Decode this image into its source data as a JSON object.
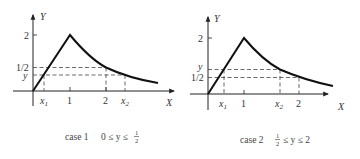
{
  "figure": {
    "panels": [
      {
        "id": "case1",
        "caption_case": "case 1",
        "caption_condition": "0 ≤ y ≤",
        "caption_frac_num": "1",
        "caption_frac_den": "2",
        "y_axis_label": "Y",
        "x_axis_label": "X",
        "y_ticks": [
          "2",
          "1/2",
          "y"
        ],
        "x_ticks": [
          "x",
          "1",
          "2",
          "x"
        ],
        "x_tick_subs": [
          "1",
          "",
          "",
          "2"
        ]
      },
      {
        "id": "case2",
        "caption_case": "case 2",
        "caption_frac_num": "1",
        "caption_frac_den": "2",
        "caption_condition": "≤ y ≤ 2",
        "y_axis_label": "Y",
        "x_axis_label": "X",
        "y_ticks": [
          "2",
          "y",
          "1/2"
        ],
        "x_ticks": [
          "x",
          "1",
          "x",
          "2"
        ],
        "x_tick_subs": [
          "1",
          "",
          "2",
          ""
        ]
      }
    ]
  },
  "colors": {
    "ink": "#222222",
    "dashed": "#444444",
    "background": "#ffffff"
  }
}
